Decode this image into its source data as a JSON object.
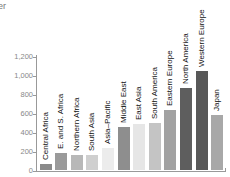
{
  "title_fragment": "er",
  "chart_data": {
    "type": "bar",
    "title": "",
    "xlabel": "",
    "ylabel": "",
    "ylim": [
      0,
      1200
    ],
    "yticks": [
      "0",
      "200",
      "400",
      "600",
      "800",
      "1,000",
      "1,200"
    ],
    "grid": false,
    "legend": null,
    "categories": [
      "Central Africa",
      "E. and S. Africa",
      "Northern Africa",
      "South Asia",
      "Asia–Pacific",
      "Middle East",
      "East Asia",
      "South America",
      "Eastern Europe",
      "North America",
      "Western Europe",
      "Japan"
    ],
    "values": [
      80,
      200,
      180,
      180,
      255,
      470,
      510,
      515,
      655,
      880,
      1065,
      600
    ],
    "colors": [
      "#8a8a8a",
      "#9a9a9a",
      "#b8b8b8",
      "#cfcfcf",
      "#ececec",
      "#8e8e8e",
      "#e6e6e6",
      "#c4c4c4",
      "#a2a2a2",
      "#5e5e5e",
      "#585858",
      "#a8a8a8"
    ]
  }
}
